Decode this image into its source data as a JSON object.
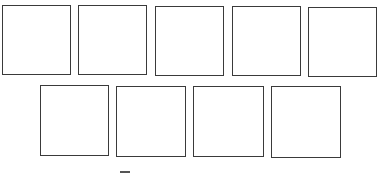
{
  "diagram": {
    "stroke_color": "#3a3a3a",
    "background": "#ffffff",
    "rows": [
      {
        "name": "top-row",
        "boxes": [
          {
            "x": 2,
            "y": 5,
            "w": 69,
            "h": 70
          },
          {
            "x": 78,
            "y": 5,
            "w": 69,
            "h": 70
          },
          {
            "x": 155,
            "y": 6,
            "w": 69,
            "h": 70
          },
          {
            "x": 232,
            "y": 6,
            "w": 69,
            "h": 70
          },
          {
            "x": 308,
            "y": 7,
            "w": 69,
            "h": 70
          }
        ]
      },
      {
        "name": "bottom-row",
        "boxes": [
          {
            "x": 40,
            "y": 85,
            "w": 69,
            "h": 71
          },
          {
            "x": 116,
            "y": 86,
            "w": 70,
            "h": 71
          },
          {
            "x": 193,
            "y": 86,
            "w": 71,
            "h": 71
          },
          {
            "x": 271,
            "y": 86,
            "w": 70,
            "h": 72
          }
        ]
      }
    ],
    "partial_mark": {
      "x": 120,
      "y": 171,
      "w": 10
    }
  }
}
